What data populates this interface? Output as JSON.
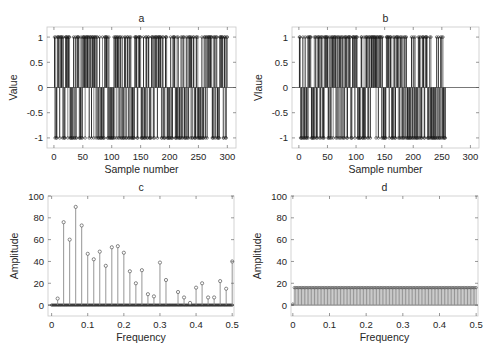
{
  "chart_data": [
    {
      "id": "a",
      "type": "stem",
      "title": "a",
      "xlabel": "Sample number",
      "ylabel": "Value",
      "xlim": [
        -12,
        315
      ],
      "ylim": [
        -1.2,
        1.2
      ],
      "xticks": [
        0,
        50,
        100,
        150,
        200,
        250,
        300
      ],
      "yticks": [
        -1,
        -0.5,
        0,
        0.5,
        1
      ],
      "ytick_labels": [
        "-1",
        "-0.5",
        "0",
        "0.5",
        "1"
      ],
      "n_samples": 300,
      "values_description": "binary sequence of +1/-1 values, samples 1..300",
      "seed": 7
    },
    {
      "id": "b",
      "type": "stem",
      "title": "b",
      "xlabel": "Sample number",
      "ylabel": "Vlaue",
      "xlim": [
        -12,
        315
      ],
      "ylim": [
        -1.2,
        1.2
      ],
      "xticks": [
        0,
        50,
        100,
        150,
        200,
        250,
        300
      ],
      "yticks": [
        -1,
        -0.5,
        0,
        0.5,
        1
      ],
      "ytick_labels": [
        "-1",
        "-0.5",
        "0",
        "0.5",
        "1"
      ],
      "n_samples": 256,
      "values_description": "binary sequence of +1/-1 values, samples 1..256",
      "seed": 13
    },
    {
      "id": "c",
      "type": "stem",
      "title": "c",
      "xlabel": "Frequency",
      "ylabel": "Amplitude",
      "xlim": [
        -0.01,
        0.505
      ],
      "ylim": [
        -10,
        100
      ],
      "xticks": [
        0,
        0.1,
        0.2,
        0.3,
        0.4,
        0.5
      ],
      "xtick_labels": [
        "0",
        "0.1",
        "0.2",
        "0.3",
        "0.4",
        "0.5"
      ],
      "yticks": [
        0,
        20,
        40,
        60,
        80,
        100
      ],
      "x": [
        0.0167,
        0.0333,
        0.05,
        0.0667,
        0.0833,
        0.1,
        0.1167,
        0.1333,
        0.15,
        0.1667,
        0.1833,
        0.2,
        0.2167,
        0.2333,
        0.25,
        0.2667,
        0.2833,
        0.3,
        0.3167,
        0.35,
        0.3667,
        0.3833,
        0.4,
        0.4167,
        0.4333,
        0.45,
        0.4667,
        0.4833,
        0.5
      ],
      "values": [
        6,
        76,
        60,
        90,
        73,
        47,
        42,
        49,
        36,
        53,
        54,
        48,
        31,
        20,
        32,
        10,
        8,
        39,
        23,
        12,
        7,
        2,
        16,
        20,
        7,
        7,
        22,
        15,
        40
      ],
      "zero_markers": 150
    },
    {
      "id": "d",
      "type": "stem",
      "title": "d",
      "xlabel": "Frequency",
      "ylabel": "Amplitude",
      "xlim": [
        -0.005,
        0.505
      ],
      "ylim": [
        -10,
        100
      ],
      "xticks": [
        0,
        0.1,
        0.2,
        0.3,
        0.4,
        0.5
      ],
      "xtick_labels": [
        "0",
        "0.1",
        "0.2",
        "0.3",
        "0.4",
        "0.5"
      ],
      "yticks": [
        0,
        20,
        40,
        60,
        80,
        100
      ],
      "n_points": 128,
      "constant_value": 16,
      "first_value": 1
    }
  ],
  "layout": {
    "panels": {
      "a": {
        "left": 47,
        "top": 27,
        "right": 236,
        "bottom": 148
      },
      "b": {
        "left": 292,
        "top": 27,
        "right": 479,
        "bottom": 148
      },
      "c": {
        "left": 48,
        "top": 196,
        "right": 234,
        "bottom": 316
      },
      "d": {
        "left": 291,
        "top": 196,
        "right": 478,
        "bottom": 316
      }
    },
    "colors": {
      "axis": "#262626",
      "stem": "#1a1a1a",
      "stem_light": "#7a7a7a",
      "box": "#c8c8c8"
    }
  }
}
